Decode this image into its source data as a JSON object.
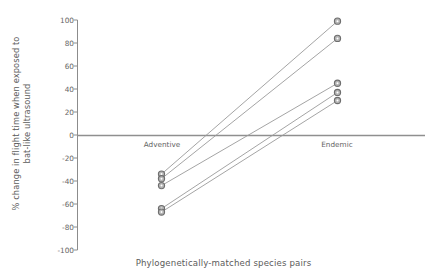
{
  "chart_data": {
    "type": "line",
    "title": "",
    "xlabel": "Phylogenetically-matched species pairs",
    "ylabel": "% change in flight time when exposed to bat-like ultrasound",
    "ylabel_line1": "% change in flight time when exposed to",
    "ylabel_line2": "bat-like ultrasound",
    "categories": [
      "Adventive",
      "Endemic"
    ],
    "ylim": [
      -100,
      100
    ],
    "yticks": [
      100,
      80,
      60,
      40,
      20,
      0,
      -20,
      -40,
      -60,
      -80,
      -100
    ],
    "ytick_labels": [
      "100",
      "80",
      "60",
      "40",
      "20",
      "0",
      "-20",
      "-40",
      "-60",
      "-80",
      "-100"
    ],
    "grid": false,
    "legend": "none",
    "zero_line": true,
    "marker": "circle-open-gray",
    "series": [
      {
        "name": "pair-1",
        "values": [
          -34,
          99
        ]
      },
      {
        "name": "pair-2",
        "values": [
          -38,
          84
        ]
      },
      {
        "name": "pair-3",
        "values": [
          -44,
          45
        ]
      },
      {
        "name": "pair-4",
        "values": [
          -64,
          37
        ]
      },
      {
        "name": "pair-5",
        "values": [
          -67,
          30
        ]
      }
    ],
    "colors": {
      "line": "#9a9a9a",
      "marker_fill": "#b3b3b3",
      "marker_stroke": "#6e6e6e",
      "axis": "#8c8c8c",
      "text": "#5b5b5b"
    }
  }
}
